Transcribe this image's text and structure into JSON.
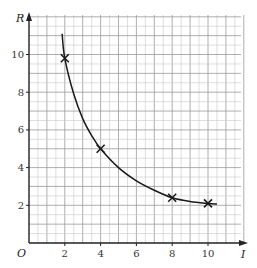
{
  "chart_data": {
    "type": "line",
    "title": "",
    "xlabel": "I",
    "ylabel": "R",
    "origin_label": "O",
    "xlim": [
      0,
      12
    ],
    "ylim": [
      0,
      12
    ],
    "x_ticks": [
      2,
      4,
      6,
      8,
      10
    ],
    "y_ticks": [
      2,
      4,
      6,
      8,
      10
    ],
    "x_tick_labels": [
      "2",
      "4",
      "6",
      "8",
      "10"
    ],
    "y_tick_labels": [
      "2",
      "4",
      "6",
      "8",
      "10"
    ],
    "grid": true,
    "grid_minor_step": 0.5,
    "grid_major_step": 1,
    "legend": null,
    "series": [
      {
        "name": "measured points",
        "marker": "x",
        "x": [
          2,
          4,
          8,
          10
        ],
        "y": [
          9.8,
          5.0,
          2.4,
          2.1
        ]
      },
      {
        "name": "curve of best fit",
        "marker": "none",
        "x": [
          1.85,
          2,
          2.5,
          3,
          3.5,
          4,
          5,
          6,
          7,
          8,
          9,
          10,
          10.5
        ],
        "y": [
          11.1,
          9.8,
          7.9,
          6.6,
          5.7,
          5.0,
          4.0,
          3.3,
          2.8,
          2.4,
          2.2,
          2.1,
          2.07
        ]
      }
    ]
  },
  "colors": {
    "background": "#ffffff",
    "grid_minor": "#c8c8c8",
    "grid_major": "#9a9a9a",
    "axis": "#222222",
    "curve": "#1a1a1a",
    "marker": "#1a1a1a"
  }
}
